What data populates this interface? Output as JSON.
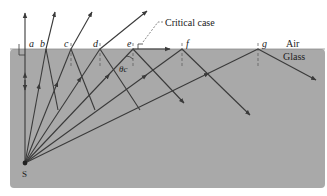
{
  "colors": {
    "background": "#ffffff",
    "glass": "#a9a9a9",
    "ray": "#3a3a3a",
    "label": "#222222"
  },
  "media": {
    "upper": "Air",
    "lower": "Glass"
  },
  "source": {
    "label": "S",
    "x": 25,
    "y": 163
  },
  "interface_y": 49,
  "annotation": {
    "critical_label": "Critical case",
    "angle_label": "θc"
  },
  "points": [
    {
      "label": "a",
      "x": 25
    },
    {
      "label": "b",
      "x": 46
    },
    {
      "label": "c",
      "x": 71
    },
    {
      "label": "d",
      "x": 100
    },
    {
      "label": "e",
      "x": 133
    },
    {
      "label": "f",
      "x": 182
    },
    {
      "label": "g",
      "x": 258
    }
  ]
}
